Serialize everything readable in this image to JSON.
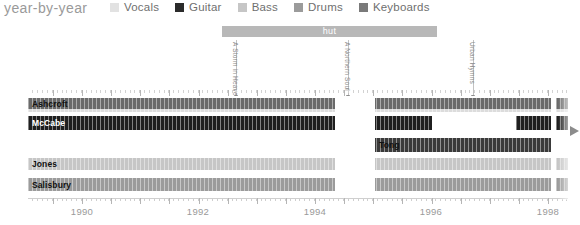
{
  "header": {
    "title": "year-by-year",
    "legend": [
      {
        "label": "Vocals",
        "color": "#e2e2e2"
      },
      {
        "label": "Guitar",
        "color": "#2b2b2b"
      },
      {
        "label": "Bass",
        "color": "#c6c6c6"
      },
      {
        "label": "Drums",
        "color": "#9b9b9b"
      },
      {
        "label": "Keyboards",
        "color": "#7a7a7a"
      }
    ]
  },
  "label_bars": [
    {
      "name": "hut",
      "x": 222,
      "width": 215
    }
  ],
  "annotations": [
    {
      "label": "A Storm in Heaven",
      "x": 236
    },
    {
      "label": "A Northern Soul",
      "x": 348
    },
    {
      "label": "Urban Hymns",
      "x": 473
    }
  ],
  "members": [
    {
      "name": "Ashcroft",
      "role": "Vocals"
    },
    {
      "name": "McCabe",
      "role": "Guitar"
    },
    {
      "name": "Jones",
      "role": "Bass"
    },
    {
      "name": "Salisbury",
      "role": "Drums"
    },
    {
      "name": "Tong",
      "role": "Guitar"
    }
  ],
  "chart_data": {
    "type": "bar",
    "title": "year-by-year",
    "xlabel": "",
    "ylabel": "",
    "grid": true,
    "legend_position": "top",
    "xlim": [
      1989.0,
      1999.6
    ],
    "categories": [
      "Ashcroft",
      "McCabe",
      "Jones",
      "Salisbury",
      "Tong"
    ],
    "tick_years": [
      1990,
      1992,
      1994,
      1996,
      1998
    ],
    "tick_x": [
      82,
      198,
      315,
      431,
      548
    ],
    "rows": [
      {
        "track": "vocals-top",
        "top": 2,
        "height": 11,
        "color": "#6a6a6a",
        "label": "Ashcroft",
        "label_color": "#111111",
        "segments": [
          {
            "x": 28,
            "width": 307
          },
          {
            "x": 375,
            "width": 176
          },
          {
            "x": 556,
            "width": 12
          }
        ]
      },
      {
        "track": "vocals-thin",
        "top": 13,
        "height": 3,
        "color": "#dcdcdc",
        "label": "",
        "label_color": "#111111",
        "segments": [
          {
            "x": 28,
            "width": 307
          },
          {
            "x": 375,
            "width": 176
          },
          {
            "x": 556,
            "width": 12
          }
        ]
      },
      {
        "track": "guitar-mccabe",
        "top": 20,
        "height": 14,
        "color": "#1f1f1f",
        "label": "McCabe",
        "label_color": "#ffffff",
        "segments": [
          {
            "x": 28,
            "width": 307
          },
          {
            "x": 375,
            "width": 57
          },
          {
            "x": 516,
            "width": 35
          },
          {
            "x": 556,
            "width": 12
          }
        ]
      },
      {
        "track": "guitar-tong",
        "top": 42,
        "height": 14,
        "color": "#3a3a3a",
        "label": "Tong",
        "label_color": "#111111",
        "segments": [
          {
            "x": 375,
            "width": 176
          }
        ]
      },
      {
        "track": "bass-jones",
        "top": 62,
        "height": 12,
        "color": "#c6c6c6",
        "label": "Jones",
        "label_color": "#111111",
        "segments": [
          {
            "x": 28,
            "width": 307
          },
          {
            "x": 375,
            "width": 176
          },
          {
            "x": 556,
            "width": 12
          }
        ]
      },
      {
        "track": "drums-salisbury",
        "top": 82,
        "height": 13,
        "color": "#9b9b9b",
        "label": "Salisbury",
        "label_color": "#111111",
        "segments": [
          {
            "x": 28,
            "width": 307
          },
          {
            "x": 375,
            "width": 176
          },
          {
            "x": 556,
            "width": 12
          }
        ]
      }
    ],
    "gap_regions": [
      {
        "x": 335,
        "width": 40,
        "note": "hiatus"
      }
    ]
  }
}
